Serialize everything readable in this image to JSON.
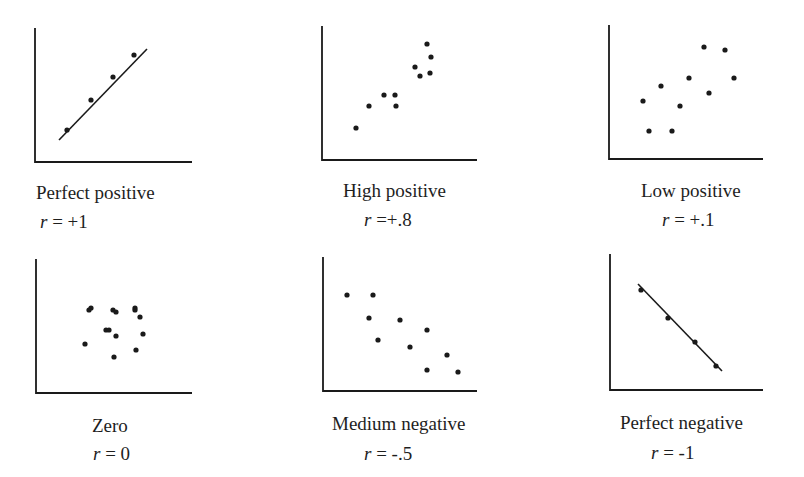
{
  "chart_data": [
    {
      "type": "scatter",
      "title": "Perfect positive",
      "r_label": "r = +1",
      "r_value": 1,
      "axes": {
        "origin": [
          35,
          162
        ],
        "top": [
          35,
          28
        ],
        "right": [
          192,
          162
        ]
      },
      "fit_line": [
        [
          59,
          140
        ],
        [
          147,
          49
        ]
      ],
      "points": [
        [
          67,
          130
        ],
        [
          91,
          100
        ],
        [
          113,
          77
        ],
        [
          134,
          55
        ]
      ],
      "title_pos": [
        36,
        183
      ],
      "r_pos": [
        40,
        212
      ]
    },
    {
      "type": "scatter",
      "title": "High positive",
      "r_label": "r =+.8",
      "r_value": 0.8,
      "axes": {
        "origin": [
          322,
          160
        ],
        "top": [
          322,
          26
        ],
        "right": [
          477,
          160
        ]
      },
      "fit_line": null,
      "points": [
        [
          356,
          128
        ],
        [
          369,
          106
        ],
        [
          384,
          95
        ],
        [
          395,
          95
        ],
        [
          396,
          106
        ],
        [
          415,
          67
        ],
        [
          420,
          76
        ],
        [
          427,
          44
        ],
        [
          431,
          57
        ],
        [
          430,
          73
        ]
      ],
      "title_pos": [
        343,
        181
      ],
      "r_pos": [
        364,
        210
      ]
    },
    {
      "type": "scatter",
      "title": "Low positive",
      "r_label": "r = +.1",
      "r_value": 0.1,
      "axes": {
        "origin": [
          609,
          159
        ],
        "top": [
          609,
          25
        ],
        "right": [
          763,
          159
        ]
      },
      "fit_line": null,
      "points": [
        [
          643,
          101
        ],
        [
          649,
          131
        ],
        [
          661,
          86
        ],
        [
          672,
          131
        ],
        [
          680,
          106
        ],
        [
          689,
          78
        ],
        [
          704,
          47
        ],
        [
          709,
          93
        ],
        [
          725,
          50
        ],
        [
          734,
          78
        ]
      ],
      "title_pos": [
        641,
        181
      ],
      "r_pos": [
        662,
        210
      ]
    },
    {
      "type": "scatter",
      "title": "Zero",
      "r_label": "r = 0",
      "r_value": 0,
      "axes": {
        "origin": [
          36,
          393
        ],
        "top": [
          36,
          259
        ],
        "right": [
          192,
          393
        ]
      },
      "fit_line": null,
      "points": [
        [
          89,
          310
        ],
        [
          91,
          308
        ],
        [
          113,
          310
        ],
        [
          116,
          312
        ],
        [
          135,
          308
        ],
        [
          135,
          310
        ],
        [
          140,
          317
        ],
        [
          106,
          330
        ],
        [
          109,
          330
        ],
        [
          116,
          336
        ],
        [
          143,
          334
        ],
        [
          85,
          344
        ],
        [
          136,
          350
        ],
        [
          114,
          357
        ]
      ],
      "title_pos": [
        92,
        416
      ],
      "r_pos": [
        93,
        444
      ]
    },
    {
      "type": "scatter",
      "title": "Medium negative",
      "r_label": "r = -.5",
      "r_value": -0.5,
      "axes": {
        "origin": [
          323,
          391
        ],
        "top": [
          323,
          257
        ],
        "right": [
          477,
          391
        ]
      },
      "fit_line": null,
      "points": [
        [
          347,
          295
        ],
        [
          373,
          295
        ],
        [
          369,
          318
        ],
        [
          400,
          320
        ],
        [
          378,
          340
        ],
        [
          427,
          330
        ],
        [
          410,
          347
        ],
        [
          447,
          355
        ],
        [
          427,
          370
        ],
        [
          458,
          372
        ]
      ],
      "title_pos": [
        332,
        414
      ],
      "r_pos": [
        364,
        444
      ]
    },
    {
      "type": "scatter",
      "title": "Perfect negative",
      "r_label": "r = -1",
      "r_value": -1,
      "axes": {
        "origin": [
          610,
          390
        ],
        "top": [
          610,
          254
        ],
        "right": [
          763,
          390
        ]
      },
      "fit_line": [
        [
          638,
          284
        ],
        [
          722,
          371
        ]
      ],
      "points": [
        [
          641,
          290
        ],
        [
          668,
          318
        ],
        [
          695,
          342
        ],
        [
          716,
          366
        ]
      ],
      "title_pos": [
        620,
        413
      ],
      "r_pos": [
        651,
        443
      ]
    }
  ],
  "style": {
    "ink_color": "#1a1a1a",
    "background": "#ffffff",
    "point_radius": 2.6,
    "axis_width": 1.8,
    "line_width": 1.6
  }
}
